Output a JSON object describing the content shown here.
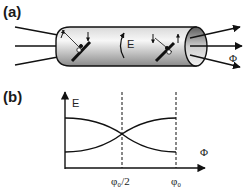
{
  "panel_a": {
    "label": "(a)",
    "field_label": "E",
    "flux_label": "Φ",
    "scatterers": 2
  },
  "panel_b": {
    "label": "(b)",
    "y_axis_label": "E",
    "x_axis_label": "Φ",
    "x_ticks": [
      "φ₀/2",
      "φ₀"
    ]
  },
  "colors": {
    "line": "#111111",
    "tube_light": "#f5f5f5",
    "tube_dark": "#8f8f8f"
  }
}
